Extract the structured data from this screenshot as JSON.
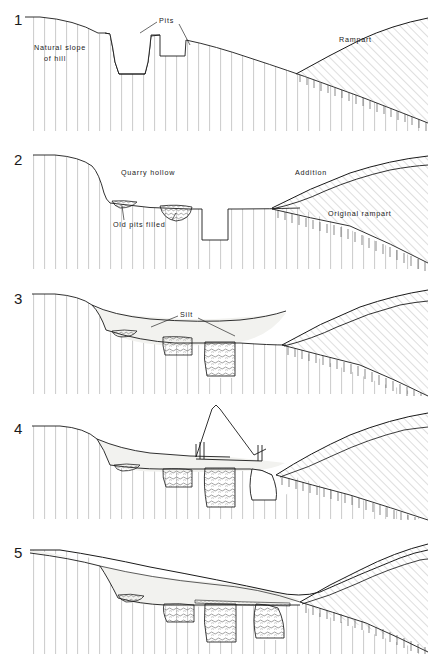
{
  "figure": {
    "type": "archaeological-section-sequence",
    "panel_count": 5,
    "colors": {
      "line": "#1a1a1a",
      "hatch_light": "#b8b8b8",
      "fill_silt": "#f0f0ee",
      "fill_chalk": "#ffffff",
      "fill_postpacking": "#d8d4cc"
    }
  },
  "panels": [
    {
      "number": "1",
      "labels": [
        {
          "name": "natural-slope-label",
          "line1": "Natural slope",
          "line2": "of hill"
        },
        {
          "name": "pits-label",
          "text": "Pits"
        },
        {
          "name": "rampart-label",
          "text": "Rampart"
        }
      ]
    },
    {
      "number": "2",
      "labels": [
        {
          "name": "quarry-hollow-label",
          "text": "Quarry hollow"
        },
        {
          "name": "old-pits-filled-label",
          "text": "Old  pits  filled"
        },
        {
          "name": "addition-label",
          "text": "Addition"
        },
        {
          "name": "original-rampart-label",
          "text": "Original rampart"
        }
      ]
    },
    {
      "number": "3",
      "labels": [
        {
          "name": "silt-label",
          "text": "Silt"
        }
      ]
    },
    {
      "number": "4",
      "labels": []
    },
    {
      "number": "5",
      "labels": []
    }
  ]
}
